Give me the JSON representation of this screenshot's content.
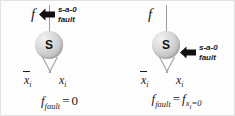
{
  "figure": {
    "caption_type": "logic-gate-stuck-at-fault-diagram",
    "background_color": "#fdfdfd",
    "node_color": "#c9c9c9",
    "arrow_color": "#000000",
    "wire_color": "#9a9a9a"
  },
  "panels": [
    {
      "id": "left",
      "output_label": "f",
      "node_label": "S",
      "inputs": [
        {
          "label": "x",
          "subscript": "i",
          "complemented": true
        },
        {
          "label": "x",
          "subscript": "i",
          "complemented": false
        }
      ],
      "fault": {
        "line1": "s-a-0",
        "line2": "fault",
        "target": "output-wire",
        "arrow_direction": "left"
      },
      "equation": {
        "lhs_base": "f",
        "lhs_sub": "fault",
        "relation": "=",
        "rhs": "0",
        "rhs_base": "",
        "rhs_sub": "",
        "text": "f_fault = 0"
      }
    },
    {
      "id": "right",
      "output_label": "f",
      "node_label": "S",
      "inputs": [
        {
          "label": "x",
          "subscript": "i",
          "complemented": true
        },
        {
          "label": "x",
          "subscript": "i",
          "complemented": false
        }
      ],
      "fault": {
        "line1": "s-a-0",
        "line2": "fault",
        "target": "input-xi",
        "arrow_direction": "left"
      },
      "equation": {
        "lhs_base": "f",
        "lhs_sub": "fault",
        "relation": "=",
        "rhs": "",
        "rhs_base": "f",
        "rhs_sub": "x",
        "rhs_sub_sub": "i",
        "rhs_sub_tail": "=0",
        "text": "f_fault = f_{x_i=0}"
      }
    }
  ]
}
